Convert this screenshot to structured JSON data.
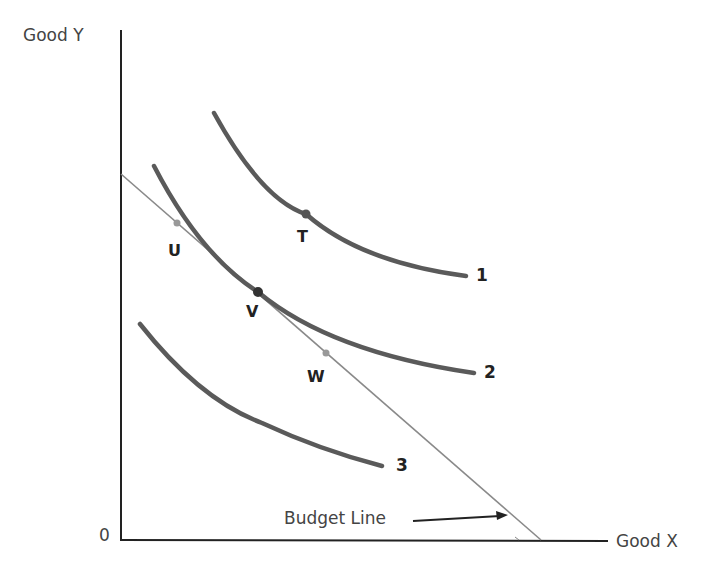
{
  "diagram": {
    "axes": {
      "y_label": "Good Y",
      "x_label": "Good X",
      "origin_label": "0"
    },
    "indifference_curves": [
      {
        "label": "1"
      },
      {
        "label": "2"
      },
      {
        "label": "3"
      }
    ],
    "points": [
      {
        "label": "T"
      },
      {
        "label": "U"
      },
      {
        "label": "V"
      },
      {
        "label": "W"
      }
    ],
    "budget_line_label": "Budget Line",
    "colors": {
      "curve": "#5a5a5a",
      "budget_line": "#8a8a8a",
      "axis": "#222222"
    }
  }
}
